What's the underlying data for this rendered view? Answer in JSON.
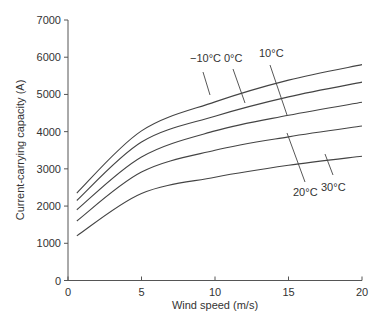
{
  "chart_data": {
    "type": "line",
    "title": "",
    "xlabel": "Wind speed (m/s)",
    "ylabel": "Current-carrying capacity (A)",
    "xlim": [
      0,
      20
    ],
    "ylim": [
      0,
      7000
    ],
    "xticks": [
      0,
      5,
      10,
      15,
      20
    ],
    "yticks": [
      0,
      1000,
      2000,
      3000,
      4000,
      5000,
      6000,
      7000
    ],
    "grid": false,
    "legend": "inline labels with leader lines",
    "x": [
      0.6,
      5,
      10,
      15,
      20
    ],
    "series": [
      {
        "name": "−10°C",
        "values": [
          2350,
          4020,
          4800,
          5385,
          5800
        ]
      },
      {
        "name": "0°C",
        "values": [
          2150,
          3720,
          4415,
          4935,
          5330
        ]
      },
      {
        "name": "10°C",
        "values": [
          1900,
          3320,
          4020,
          4440,
          4790
        ]
      },
      {
        "name": "20°C",
        "values": [
          1600,
          2915,
          3500,
          3860,
          4150
        ]
      },
      {
        "name": "30°C",
        "values": [
          1200,
          2340,
          2775,
          3095,
          3340
        ]
      }
    ]
  },
  "labels": {
    "m10": "−10°C",
    "c0": "0°C",
    "c10": "10°C",
    "c20": "20°C",
    "c30": "30°C"
  },
  "axes": {
    "xlabel": "Wind speed (m/s)",
    "ylabel": "Current-carrying capacity (A)",
    "xticks": [
      "0",
      "5",
      "10",
      "15",
      "20"
    ],
    "yticks": [
      "0",
      "1000",
      "2000",
      "3000",
      "4000",
      "5000",
      "6000",
      "7000"
    ]
  },
  "colors": {
    "line": "#444444",
    "axis": "#555555",
    "text": "#333333"
  }
}
